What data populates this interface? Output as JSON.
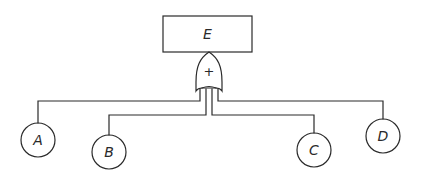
{
  "diagram": {
    "type": "fault-tree",
    "top_event": {
      "label": "E"
    },
    "gate": {
      "type": "OR",
      "symbol": "+"
    },
    "basic_events": [
      {
        "label": "A"
      },
      {
        "label": "B"
      },
      {
        "label": "C"
      },
      {
        "label": "D"
      }
    ],
    "edges": [
      {
        "from": "OR-gate",
        "to": "E"
      },
      {
        "from": "A",
        "to": "OR-gate"
      },
      {
        "from": "B",
        "to": "OR-gate"
      },
      {
        "from": "C",
        "to": "OR-gate"
      },
      {
        "from": "D",
        "to": "OR-gate"
      }
    ],
    "colors": {
      "line": "#2a2a2a",
      "background": "#ffffff"
    }
  }
}
